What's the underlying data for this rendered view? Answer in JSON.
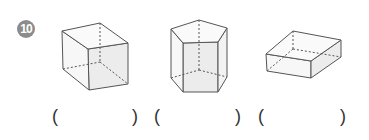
{
  "question": {
    "number": "10",
    "badge_color": "#8c8c8c"
  },
  "figures": [
    {
      "name": "cube",
      "label": "rectangular prism (cube)"
    },
    {
      "name": "pentagonal-prism",
      "label": "pentagonal prism"
    },
    {
      "name": "flat-box",
      "label": "rectangular prism (flat box)"
    }
  ],
  "answers": [
    {
      "open": "(",
      "close": ")",
      "value": ""
    },
    {
      "open": "(",
      "close": ")",
      "value": ""
    },
    {
      "open": "(",
      "close": ")",
      "value": ""
    }
  ]
}
